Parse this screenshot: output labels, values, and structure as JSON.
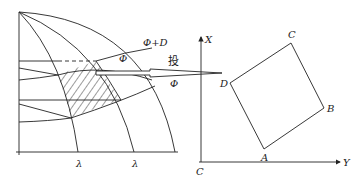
{
  "diagram": {
    "left_panel": {
      "labels": {
        "phi_plus_d": "Φ+D",
        "phi_upper": "Φ",
        "phi_lower": "Φ",
        "lambda_1": "λ",
        "lambda_2": "λ"
      },
      "hatched_region": "projected cell between parallels and meridians"
    },
    "arrow": {
      "label": "投"
    },
    "right_panel": {
      "axes": {
        "x_label": "X",
        "y_label": "Y",
        "origin_label": "C"
      },
      "quad_vertices": {
        "A": "A",
        "B": "B",
        "C": "C",
        "D": "D"
      }
    },
    "colors": {
      "line": "#222222",
      "background": "#ffffff"
    }
  }
}
